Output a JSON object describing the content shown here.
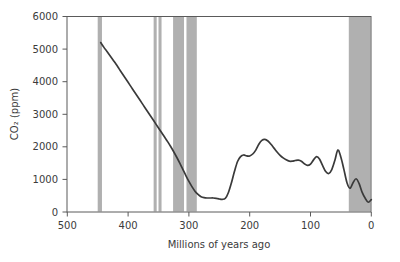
{
  "figure": {
    "background": "#ffffff",
    "frame_color": "#5a5a5a",
    "curve_color": "#3a3a3a",
    "band_color": "#b0b0b0"
  },
  "chart_data": {
    "type": "line",
    "title": "",
    "xlabel": "Millions of years ago",
    "ylabel": "CO2 (ppm)",
    "ylabel_display": "CO₂ (ppm)",
    "xlim": [
      540,
      0
    ],
    "ylim": [
      0,
      6000
    ],
    "x_reversed": true,
    "grid": false,
    "legend": null,
    "xticks": [
      500,
      400,
      300,
      200,
      100,
      0
    ],
    "xtick_labels": [
      "500",
      "400",
      "300",
      "200",
      "100",
      "0"
    ],
    "yticks": [
      0,
      1000,
      2000,
      3000,
      4000,
      5000,
      6000
    ],
    "ytick_labels": [
      "0",
      "1000",
      "2000",
      "3000",
      "4000",
      "5000",
      "6000"
    ],
    "series": [
      {
        "name": "Atmospheric CO2",
        "x": [
          445,
          440,
          435,
          430,
          425,
          420,
          415,
          410,
          405,
          400,
          395,
          390,
          385,
          380,
          375,
          370,
          365,
          360,
          355,
          350,
          345,
          340,
          335,
          330,
          325,
          320,
          315,
          310,
          305,
          300,
          295,
          290,
          285,
          280,
          275,
          270,
          265,
          260,
          255,
          250,
          245,
          240,
          235,
          230,
          225,
          220,
          215,
          210,
          205,
          200,
          195,
          190,
          185,
          180,
          175,
          170,
          165,
          160,
          155,
          150,
          145,
          140,
          135,
          130,
          125,
          120,
          115,
          110,
          105,
          100,
          95,
          90,
          85,
          80,
          75,
          70,
          65,
          60,
          55,
          50,
          45,
          40,
          35,
          30,
          25,
          20,
          15,
          10,
          5,
          0
        ],
        "y": [
          5200,
          5060,
          4930,
          4800,
          4670,
          4540,
          4400,
          4260,
          4120,
          3980,
          3840,
          3700,
          3560,
          3420,
          3280,
          3140,
          3000,
          2860,
          2720,
          2580,
          2440,
          2300,
          2160,
          2010,
          1850,
          1680,
          1500,
          1310,
          1120,
          940,
          780,
          640,
          540,
          470,
          440,
          430,
          430,
          430,
          420,
          400,
          390,
          420,
          600,
          900,
          1250,
          1550,
          1700,
          1750,
          1720,
          1720,
          1780,
          1900,
          2080,
          2200,
          2230,
          2180,
          2080,
          1960,
          1840,
          1740,
          1660,
          1600,
          1560,
          1560,
          1580,
          1590,
          1560,
          1480,
          1430,
          1470,
          1600,
          1700,
          1620,
          1420,
          1240,
          1180,
          1300,
          1580,
          1900,
          1680,
          1300,
          900,
          730,
          900,
          1020,
          870,
          600,
          420,
          300,
          380
        ],
        "unit": "ppm"
      }
    ],
    "shaded_bands": {
      "description": "gray vertical bands marking glacial intervals",
      "color": "#b0b0b0",
      "intervals_myr": [
        [
          450,
          443
        ],
        [
          358,
          353
        ],
        [
          350,
          345
        ],
        [
          326,
          308
        ],
        [
          304,
          287
        ],
        [
          37,
          0
        ]
      ]
    }
  }
}
